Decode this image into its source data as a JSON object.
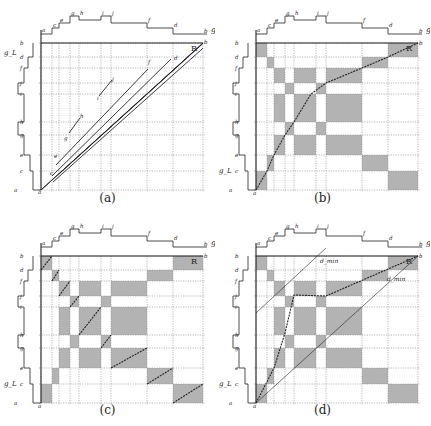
{
  "figure": {
    "panels": [
      {
        "id": "a",
        "caption": "(a)"
      },
      {
        "id": "b",
        "caption": "(b)"
      },
      {
        "id": "c",
        "caption": "(c)"
      },
      {
        "id": "d",
        "caption": "(d)"
      }
    ],
    "axis_labels": {
      "top_right": "g_R",
      "left_bottom": "g_L",
      "corner": "R",
      "d_min_upper": "d_min",
      "d_min_lower": "d_min"
    },
    "top_letters": [
      "a",
      "c",
      "e",
      "g",
      "h",
      "i",
      "j",
      "f",
      "d",
      "b"
    ],
    "left_letters": [
      "a",
      "c",
      "e",
      "g",
      "h",
      "i",
      "j",
      "f",
      "d",
      "b"
    ],
    "diagonal_letters_a": [
      "c",
      "e",
      "g",
      "h",
      "i",
      "j",
      "f",
      "d",
      "b"
    ],
    "shaded_cells_rows_top_to_bottom": [
      [
        0,
        8
      ],
      [
        1,
        7
      ],
      [
        2,
        4,
        6
      ],
      [
        3,
        5
      ],
      [
        2,
        4,
        6
      ],
      [
        3,
        5
      ],
      [
        2,
        4,
        6
      ],
      [
        1,
        7
      ],
      [
        0,
        8
      ]
    ],
    "colors": {
      "shade": "#b3b3b3",
      "line": "#222222",
      "grid": "#888888"
    }
  }
}
